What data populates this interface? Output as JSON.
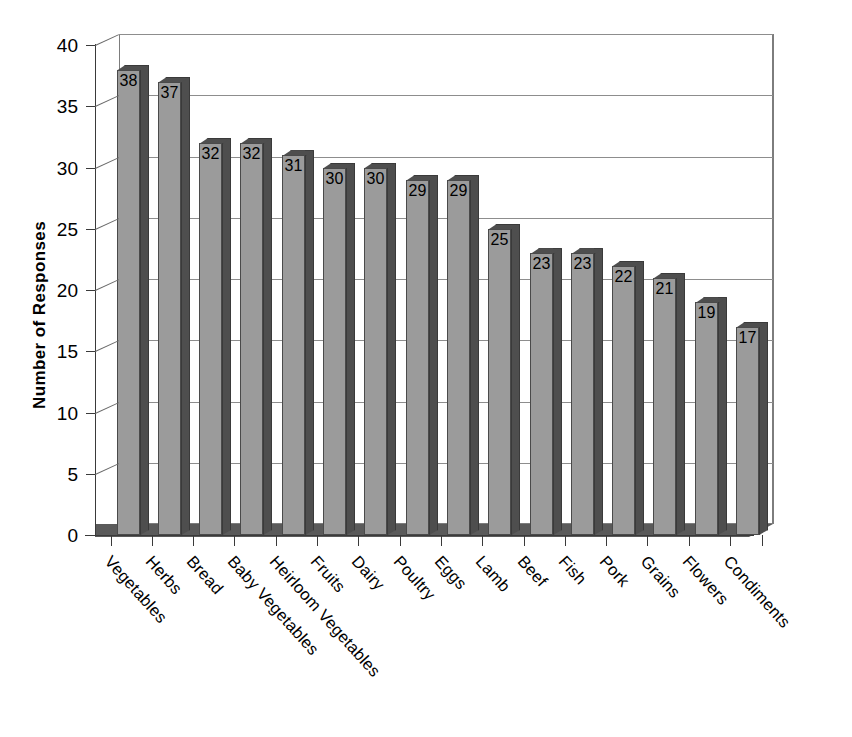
{
  "chart_data": {
    "type": "bar",
    "title": "",
    "subtitle": "",
    "xlabel": "",
    "ylabel": "Number of Responses",
    "ylim": [
      0,
      40
    ],
    "ytick_values": [
      0,
      5,
      10,
      15,
      20,
      25,
      30,
      35,
      40
    ],
    "ytick_labels": [
      "0",
      "5",
      "10",
      "15",
      "20",
      "25",
      "30",
      "35",
      "40"
    ],
    "grid": "horizontal",
    "legend": "none",
    "style": "3d-column",
    "data_labels": true,
    "categories": [
      "Vegetables",
      "Herbs",
      "Bread",
      "Baby Vegetables",
      "Heirloom Vegetables",
      "Fruits",
      "Dairy",
      "Poultry",
      "Eggs",
      "Lamb",
      "Beef",
      "Fish",
      "Pork",
      "Grains",
      "Flowers",
      "Condiments"
    ],
    "values": [
      38,
      37,
      32,
      32,
      31,
      30,
      30,
      29,
      29,
      25,
      23,
      23,
      22,
      21,
      19,
      17
    ],
    "value_labels": [
      "38",
      "37",
      "32",
      "32",
      "31",
      "30",
      "30",
      "29",
      "29",
      "25",
      "23",
      "23",
      "22",
      "21",
      "19",
      "17"
    ],
    "colors": {
      "bar_front": "#9b9b9b",
      "bar_side": "#4e4e4e",
      "bar_top": "#4e4e4e",
      "bar_outline": "#3a3a3a",
      "floor": "#5a5a5a",
      "gridline": "#8d8d8d",
      "axis": "#3a3a3a",
      "background": "#ffffff",
      "text": "#000000"
    }
  }
}
